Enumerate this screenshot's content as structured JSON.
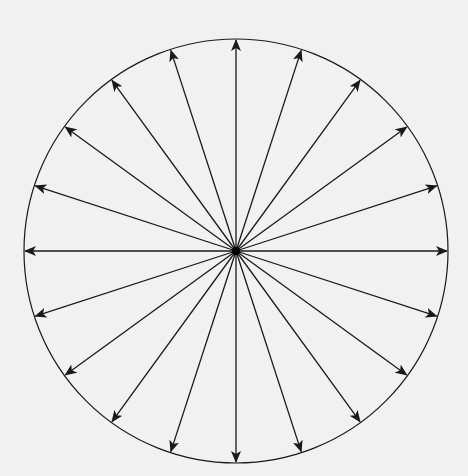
{
  "diagram": {
    "type": "radial-arrows",
    "center": [
      236,
      251
    ],
    "radius": 212,
    "arrow_count": 20,
    "angle_step_deg": 18,
    "start_angle_deg": 0,
    "stroke_color": "#1a1a1a",
    "background_color": "#f1f1f1",
    "center_dot_radius": 4
  }
}
